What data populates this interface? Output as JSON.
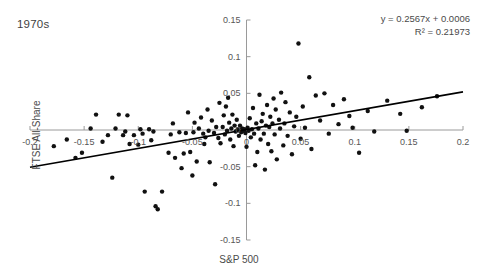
{
  "chart_data": {
    "type": "scatter",
    "title": "1970s",
    "xlabel": "S&P 500",
    "ylabel": "FTSE All-Share",
    "xlim": [
      -0.2,
      0.2
    ],
    "ylim": [
      -0.15,
      0.15
    ],
    "xticks": [
      -0.2,
      -0.15,
      -0.1,
      -0.05,
      0,
      0.05,
      0.1,
      0.15,
      0.2
    ],
    "xticklabels": [
      "-0.2",
      "-0.15",
      "-0.1",
      "-0.05",
      "0",
      "0.05",
      "0.1",
      "0.15",
      "0.2"
    ],
    "yticks": [
      0.15,
      0.1,
      0.05,
      0,
      -0.05,
      -0.1,
      -0.15
    ],
    "yticklabels": [
      "0.15",
      "0.1",
      "0.05",
      "0",
      "-0.05",
      "-0.1",
      "-0.15"
    ],
    "grid": false,
    "legend": null,
    "annotations": [
      "y = 0.2567x + 0.0006",
      "R² = 0.21973"
    ],
    "trendline": {
      "slope": 0.2567,
      "intercept": 0.0006,
      "r_squared": 0.21973,
      "x_start": -0.2,
      "x_end": 0.2,
      "color": "#000000"
    },
    "marker": {
      "shape": "circle",
      "color": "#111111",
      "size": 2.2
    },
    "points": [
      [
        -0.178,
        -0.022
      ],
      [
        -0.166,
        -0.013
      ],
      [
        -0.158,
        -0.038
      ],
      [
        -0.152,
        -0.031
      ],
      [
        -0.144,
        0.002
      ],
      [
        -0.139,
        0.021
      ],
      [
        -0.133,
        -0.016
      ],
      [
        -0.128,
        -0.007
      ],
      [
        -0.124,
        -0.065
      ],
      [
        -0.121,
        0.002
      ],
      [
        -0.118,
        0.021
      ],
      [
        -0.114,
        -0.007
      ],
      [
        -0.112,
        -0.002
      ],
      [
        -0.11,
        0.02
      ],
      [
        -0.108,
        -0.019
      ],
      [
        -0.104,
        -0.007
      ],
      [
        -0.1,
        -0.02
      ],
      [
        -0.098,
        0.001
      ],
      [
        -0.096,
        -0.005
      ],
      [
        -0.094,
        -0.084
      ],
      [
        -0.09,
        0.001
      ],
      [
        -0.088,
        -0.014
      ],
      [
        -0.086,
        -0.002
      ],
      [
        -0.084,
        -0.104
      ],
      [
        -0.082,
        -0.108
      ],
      [
        -0.078,
        -0.084
      ],
      [
        -0.072,
        -0.031
      ],
      [
        -0.07,
        -0.006
      ],
      [
        -0.068,
        0.009
      ],
      [
        -0.066,
        -0.038
      ],
      [
        -0.062,
        -0.003
      ],
      [
        -0.06,
        -0.052
      ],
      [
        -0.058,
        -0.032
      ],
      [
        -0.056,
        -0.004
      ],
      [
        -0.054,
        0.024
      ],
      [
        -0.052,
        -0.03
      ],
      [
        -0.05,
        -0.062
      ],
      [
        -0.049,
        -0.003
      ],
      [
        -0.048,
        0.01
      ],
      [
        -0.046,
        -0.043
      ],
      [
        -0.044,
        0.002
      ],
      [
        -0.042,
        0.017
      ],
      [
        -0.04,
        -0.005
      ],
      [
        -0.039,
        -0.019
      ],
      [
        -0.038,
        -0.01
      ],
      [
        -0.036,
        0.028
      ],
      [
        -0.035,
        -0.001
      ],
      [
        -0.034,
        -0.044
      ],
      [
        -0.032,
        0.013
      ],
      [
        -0.03,
        -0.004
      ],
      [
        -0.029,
        -0.074
      ],
      [
        -0.028,
        0.004
      ],
      [
        -0.026,
        -0.011
      ],
      [
        -0.025,
        0.037
      ],
      [
        -0.024,
        -0.018
      ],
      [
        -0.022,
        0.004
      ],
      [
        -0.021,
        0.02
      ],
      [
        -0.02,
        -0.006
      ],
      [
        -0.019,
        0.032
      ],
      [
        -0.018,
        -0.001
      ],
      [
        -0.017,
        0.044
      ],
      [
        -0.016,
        0.01
      ],
      [
        -0.015,
        -0.013
      ],
      [
        -0.014,
        0.002
      ],
      [
        -0.013,
        0.021
      ],
      [
        -0.012,
        -0.022
      ],
      [
        -0.011,
        0.006
      ],
      [
        -0.01,
        -0.002
      ],
      [
        -0.009,
        0.014
      ],
      [
        -0.008,
        0.001
      ],
      [
        -0.007,
        -0.008
      ],
      [
        -0.006,
        0.006
      ],
      [
        -0.005,
        -0.003
      ],
      [
        -0.004,
        0.002
      ],
      [
        -0.003,
        -0.001
      ],
      [
        -0.002,
        0.001
      ],
      [
        -0.001,
        -0.004
      ],
      [
        0.0,
        -0.023
      ],
      [
        0.001,
        0.003
      ],
      [
        0.002,
        -0.001
      ],
      [
        0.003,
        0.016
      ],
      [
        0.004,
        -0.01
      ],
      [
        0.005,
        0.001
      ],
      [
        0.006,
        0.03
      ],
      [
        0.007,
        -0.005
      ],
      [
        0.008,
        -0.048
      ],
      [
        0.009,
        0.009
      ],
      [
        0.01,
        -0.03
      ],
      [
        0.011,
        0.002
      ],
      [
        0.012,
        0.048
      ],
      [
        0.013,
        -0.013
      ],
      [
        0.014,
        0.012
      ],
      [
        0.015,
        0.022
      ],
      [
        0.016,
        -0.005
      ],
      [
        0.017,
        -0.054
      ],
      [
        0.018,
        0.006
      ],
      [
        0.019,
        0.034
      ],
      [
        0.02,
        -0.019
      ],
      [
        0.021,
        0.004
      ],
      [
        0.022,
        0.018
      ],
      [
        0.023,
        -0.029
      ],
      [
        0.024,
        0.009
      ],
      [
        0.025,
        0.043
      ],
      [
        0.026,
        -0.006
      ],
      [
        0.027,
        0.028
      ],
      [
        0.028,
        -0.04
      ],
      [
        0.03,
        0.014
      ],
      [
        0.031,
        0.002
      ],
      [
        0.032,
        0.051
      ],
      [
        0.034,
        -0.021
      ],
      [
        0.035,
        0.009
      ],
      [
        0.036,
        0.038
      ],
      [
        0.038,
        -0.008
      ],
      [
        0.04,
        0.024
      ],
      [
        0.042,
        -0.033
      ],
      [
        0.044,
        0.005
      ],
      [
        0.046,
        0.018
      ],
      [
        0.048,
        0.118
      ],
      [
        0.05,
        -0.012
      ],
      [
        0.052,
        0.032
      ],
      [
        0.054,
        0.003
      ],
      [
        0.058,
        0.072
      ],
      [
        0.06,
        -0.026
      ],
      [
        0.064,
        0.047
      ],
      [
        0.068,
        0.013
      ],
      [
        0.072,
        0.05
      ],
      [
        0.076,
        -0.005
      ],
      [
        0.08,
        0.034
      ],
      [
        0.085,
        0.008
      ],
      [
        0.09,
        0.042
      ],
      [
        0.095,
        0.019
      ],
      [
        0.098,
        0.003
      ],
      [
        0.104,
        -0.031
      ],
      [
        0.112,
        0.026
      ],
      [
        0.118,
        -0.002
      ],
      [
        0.13,
        0.04
      ],
      [
        0.142,
        0.022
      ],
      [
        0.148,
        -0.001
      ],
      [
        0.162,
        0.031
      ],
      [
        0.176,
        0.046
      ]
    ]
  }
}
